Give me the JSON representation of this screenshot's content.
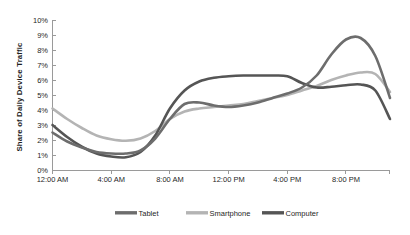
{
  "chart_data": {
    "type": "line",
    "title": "",
    "subtitle": "",
    "xlabel": "",
    "ylabel": "Share of Daily Device Traffic",
    "grid": false,
    "legend_position": "bottom",
    "ylim": [
      0,
      10
    ],
    "xlim": [
      0,
      23
    ],
    "y_tick_labels": [
      "10%",
      "9%",
      "8%",
      "7%",
      "6%",
      "5%",
      "4%",
      "3%",
      "2%",
      "1%",
      "0%"
    ],
    "y_tick_values": [
      10,
      9,
      8,
      7,
      6,
      5,
      4,
      3,
      2,
      1,
      0
    ],
    "x_tick_labels": [
      "12:00 AM",
      "4:00 AM",
      "8:00 AM",
      "12:00 PM",
      "4:00 PM",
      "8:00 PM"
    ],
    "x_tick_values": [
      0,
      4,
      8,
      12,
      16,
      20
    ],
    "x": [
      0,
      1,
      2,
      3,
      4,
      5,
      6,
      7,
      8,
      9,
      10,
      11,
      12,
      13,
      14,
      15,
      16,
      17,
      18,
      19,
      20,
      21,
      22,
      23
    ],
    "series": [
      {
        "name": "Tablet",
        "color": "#6d6d6d",
        "values": [
          2.5,
          1.9,
          1.5,
          1.2,
          1.1,
          1.1,
          1.3,
          2.1,
          3.4,
          4.4,
          4.5,
          4.3,
          4.2,
          4.3,
          4.5,
          4.8,
          5.1,
          5.5,
          6.3,
          7.7,
          8.7,
          8.8,
          7.6,
          4.8
        ]
      },
      {
        "name": "Smartphone",
        "color": "#b4b4b4",
        "values": [
          4.1,
          3.4,
          2.8,
          2.3,
          2.05,
          1.95,
          2.1,
          2.6,
          3.4,
          3.9,
          4.1,
          4.2,
          4.3,
          4.4,
          4.6,
          4.8,
          5.0,
          5.3,
          5.6,
          6.0,
          6.3,
          6.5,
          6.4,
          5.2
        ]
      },
      {
        "name": "Computer",
        "color": "#555555",
        "values": [
          3.0,
          2.2,
          1.55,
          1.1,
          0.9,
          0.85,
          1.2,
          2.3,
          4.1,
          5.3,
          5.9,
          6.15,
          6.25,
          6.3,
          6.3,
          6.3,
          6.25,
          5.8,
          5.5,
          5.55,
          5.65,
          5.7,
          5.3,
          3.4
        ]
      }
    ],
    "legend": [
      {
        "label": "Tablet",
        "color": "#6d6d6d"
      },
      {
        "label": "Smartphone",
        "color": "#b4b4b4"
      },
      {
        "label": "Computer",
        "color": "#555555"
      }
    ]
  }
}
